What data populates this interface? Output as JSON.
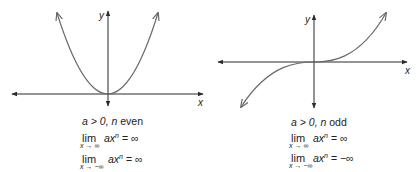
{
  "figures": [
    {
      "id": "even",
      "axis_labels": {
        "x": "x",
        "y": "y"
      },
      "title": {
        "a_cond": "a > 0,",
        "n_var": "n",
        "parity": "even"
      },
      "limits": [
        {
          "lim": "lim",
          "sub": "x → ∞",
          "expr": "ax",
          "exp": "n",
          "result": "= ∞"
        },
        {
          "lim": "lim",
          "sub": "x → −∞",
          "expr": "ax",
          "exp": "n",
          "result": "= ∞"
        }
      ]
    },
    {
      "id": "odd",
      "axis_labels": {
        "x": "x",
        "y": "y"
      },
      "title": {
        "a_cond": "a > 0,",
        "n_var": "n",
        "parity": "odd"
      },
      "limits": [
        {
          "lim": "lim",
          "sub": "x → ∞",
          "expr": "ax",
          "exp": "n",
          "result": "= ∞"
        },
        {
          "lim": "lim",
          "sub": "x → −∞",
          "expr": "ax",
          "exp": "n",
          "result": "= −∞"
        }
      ]
    }
  ],
  "colors": {
    "axis": "#2a2a2a",
    "curve": "#6a6a6a"
  }
}
